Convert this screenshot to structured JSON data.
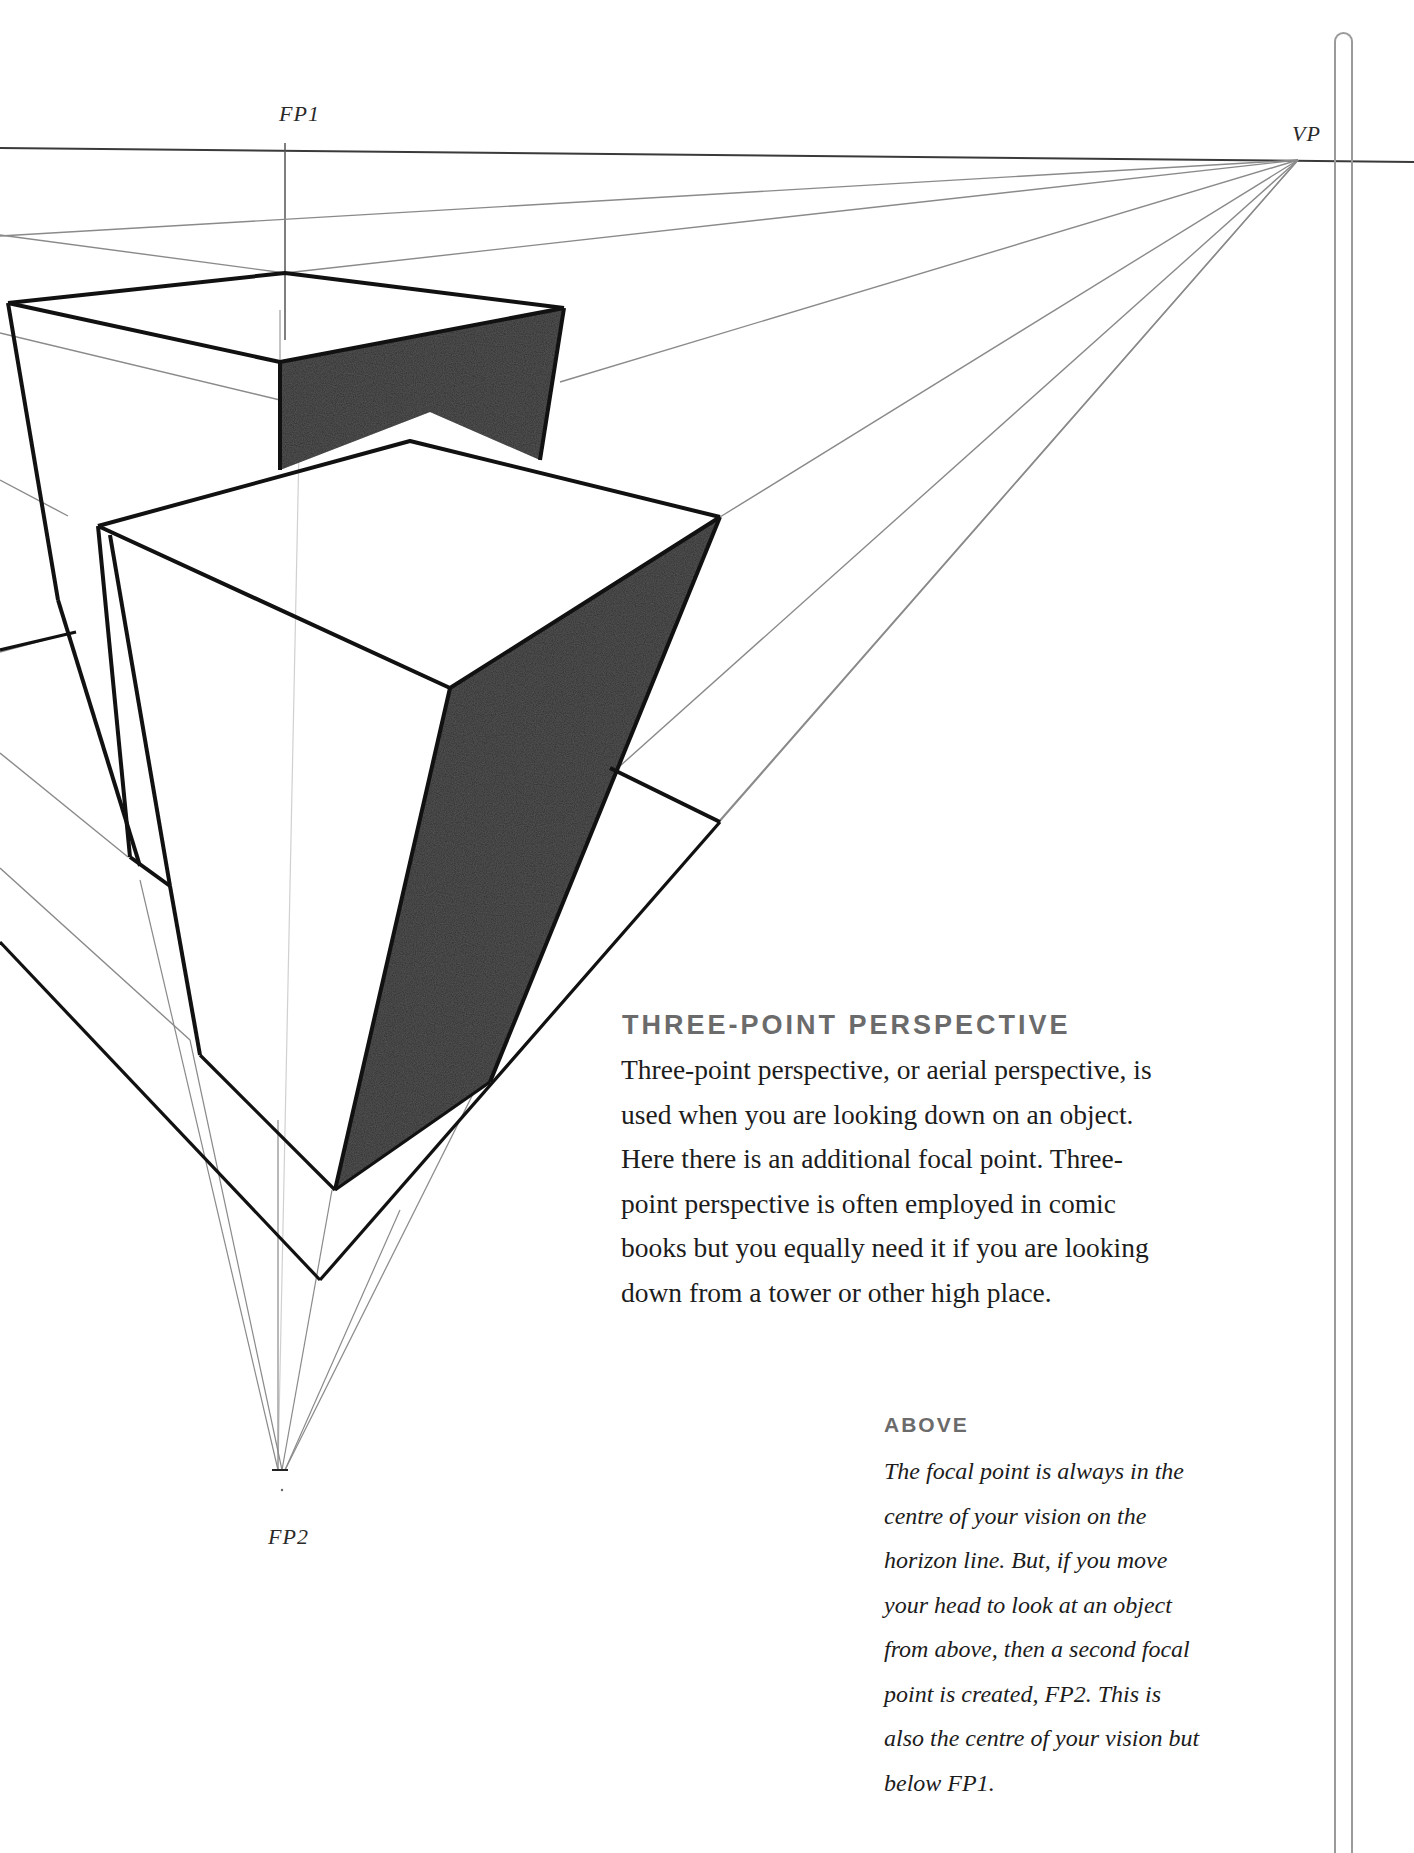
{
  "labels": {
    "fp1": "FP1",
    "vp": "VP",
    "fp2": "FP2"
  },
  "section": {
    "heading": "THREE-POINT PERSPECTIVE",
    "lines": [
      "Three-point perspective, or aerial perspective, is",
      "used when you are looking down on an object.",
      "Here there is an additional focal point. Three-",
      "point perspective is often employed in comic",
      "books but you equally need it if you are looking",
      "down from a tower or other high place."
    ]
  },
  "caption": {
    "heading": "ABOVE",
    "lines": [
      "The focal point is always in the",
      "centre of your vision on the",
      "horizon line. But, if you move",
      "your head to look at an object",
      "from above, then a second focal",
      "point is created, FP2. This is",
      "also the centre of your vision but",
      "below FP1."
    ]
  },
  "colors": {
    "ink": "#1a1a1a",
    "guide": "#8a8a8a",
    "shade": "#3a3a3a",
    "heading_gray": "#6b6b6b"
  }
}
